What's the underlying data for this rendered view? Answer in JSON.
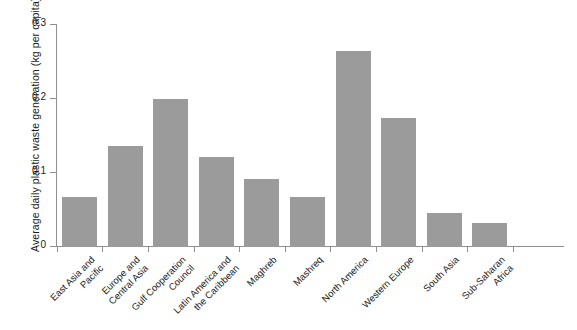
{
  "chart_data": {
    "type": "bar",
    "title": "",
    "subtitle": "",
    "xlabel": "",
    "ylabel": "Average daily plastic waste generation (kg per capita)",
    "ylim": [
      0,
      0.3
    ],
    "ytick_labels": [
      "0",
      "0.1",
      "0.2",
      "0.3"
    ],
    "ytick_values": [
      0,
      0.1,
      0.2,
      0.3
    ],
    "grid": false,
    "legend": false,
    "bar_color": "#9b9b9b",
    "axis_color": "#8f8f8f",
    "text_color": "#1a1a1a",
    "background": "#ffffff",
    "categories": [
      "East Asia and\nPacific",
      "Europe and\nCentral Asia",
      "Gulf Cooperation\nCouncil",
      "Latin America and\nthe Caribbean",
      "Maghreb",
      "Mashreq",
      "North America",
      "Western Europe",
      "South Asia",
      "Sub-Saharan\nAfrica"
    ],
    "values": [
      0.068,
      0.136,
      0.2,
      0.122,
      0.092,
      0.067,
      0.265,
      0.175,
      0.046,
      0.032
    ]
  }
}
